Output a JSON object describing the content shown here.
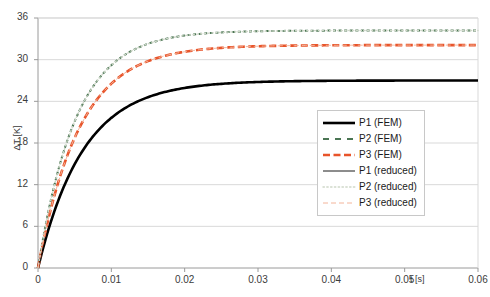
{
  "chart_data": {
    "type": "line",
    "title": "",
    "xlabel": "t [s]",
    "ylabel": "ΔT [K]",
    "xlim": [
      0,
      0.06
    ],
    "ylim": [
      0,
      36
    ],
    "xticks": [
      "0",
      "0.01",
      "0.02",
      "0.03",
      "0.04",
      "0.05",
      "0.06"
    ],
    "xtick_values": [
      0,
      0.01,
      0.02,
      0.03,
      0.04,
      0.05,
      0.06
    ],
    "yticks": [
      "0",
      "6",
      "12",
      "18",
      "24",
      "30",
      "36"
    ],
    "ytick_values": [
      0,
      6,
      12,
      18,
      24,
      30,
      36
    ],
    "grid": "horizontal",
    "legend_position": "center-right",
    "series": [
      {
        "name": "P1 (FEM)",
        "color": "#000000",
        "style": "solid",
        "width": 2.6,
        "plateau": 27.0,
        "tau": 0.0062,
        "x": [
          0,
          0.001,
          0.002,
          0.003,
          0.004,
          0.005,
          0.006,
          0.008,
          0.01,
          0.012,
          0.014,
          0.016,
          0.018,
          0.02,
          0.024,
          0.028,
          0.032,
          0.036,
          0.04,
          0.045,
          0.05,
          0.055,
          0.06
        ],
        "y": [
          0,
          4.0,
          7.5,
          10.6,
          13.3,
          15.6,
          17.6,
          20.9,
          23.2,
          24.8,
          25.9,
          26.3,
          26.6,
          26.8,
          26.9,
          27.0,
          27.0,
          27.0,
          27.0,
          27.0,
          27.0,
          27.0,
          27.0
        ]
      },
      {
        "name": "P2 (FEM)",
        "color": "#4a7553",
        "style": "dashed-short",
        "width": 2.0,
        "plateau": 34.2,
        "tau": 0.0052,
        "x": [
          0,
          0.001,
          0.002,
          0.003,
          0.004,
          0.005,
          0.006,
          0.008,
          0.01,
          0.012,
          0.014,
          0.016,
          0.018,
          0.02,
          0.024,
          0.028,
          0.032,
          0.036,
          0.04,
          0.045,
          0.05,
          0.055,
          0.06
        ],
        "y": [
          0,
          5.9,
          11.0,
          15.4,
          19.1,
          22.2,
          24.8,
          28.6,
          31.0,
          32.4,
          33.2,
          33.7,
          33.9,
          34.0,
          34.2,
          34.2,
          34.2,
          34.2,
          34.2,
          34.2,
          34.2,
          34.2,
          34.2
        ]
      },
      {
        "name": "P3 (FEM)",
        "color": "#e8542a",
        "style": "dashed",
        "width": 2.6,
        "plateau": 32.1,
        "tau": 0.0057,
        "x": [
          0,
          0.001,
          0.002,
          0.003,
          0.004,
          0.005,
          0.006,
          0.008,
          0.01,
          0.012,
          0.014,
          0.016,
          0.018,
          0.02,
          0.024,
          0.028,
          0.032,
          0.036,
          0.04,
          0.045,
          0.05,
          0.055,
          0.06
        ],
        "y": [
          0,
          5.2,
          9.8,
          13.8,
          17.2,
          20.1,
          22.6,
          26.4,
          28.9,
          30.4,
          31.2,
          31.7,
          31.9,
          32.0,
          32.1,
          32.1,
          32.1,
          32.1,
          32.1,
          32.1,
          32.1,
          32.1,
          32.1
        ]
      },
      {
        "name": "P1 (reduced)",
        "color": "#000000",
        "style": "solid-thin",
        "width": 0.9,
        "plateau": 27.0,
        "tau": 0.0062,
        "x": [
          0,
          0.001,
          0.002,
          0.003,
          0.004,
          0.005,
          0.006,
          0.008,
          0.01,
          0.012,
          0.014,
          0.016,
          0.018,
          0.02,
          0.024,
          0.028,
          0.032,
          0.036,
          0.04,
          0.045,
          0.05,
          0.055,
          0.06
        ],
        "y": [
          0,
          4.0,
          7.5,
          10.6,
          13.3,
          15.6,
          17.6,
          20.9,
          23.2,
          24.8,
          25.9,
          26.3,
          26.6,
          26.8,
          26.9,
          27.0,
          27.0,
          27.0,
          27.0,
          27.0,
          27.0,
          27.0,
          27.0
        ]
      },
      {
        "name": "P2 (reduced)",
        "color": "#cfd8c9",
        "style": "dotted",
        "width": 1.4,
        "plateau": 34.2,
        "tau": 0.0052,
        "x": [
          0,
          0.001,
          0.002,
          0.003,
          0.004,
          0.005,
          0.006,
          0.008,
          0.01,
          0.012,
          0.014,
          0.016,
          0.018,
          0.02,
          0.024,
          0.028,
          0.032,
          0.036,
          0.04,
          0.045,
          0.05,
          0.055,
          0.06
        ],
        "y": [
          0,
          5.9,
          11.0,
          15.4,
          19.1,
          22.2,
          24.8,
          28.6,
          31.0,
          32.4,
          33.2,
          33.7,
          33.9,
          34.0,
          34.2,
          34.2,
          34.2,
          34.2,
          34.2,
          34.2,
          34.2,
          34.2,
          34.2
        ]
      },
      {
        "name": "P3 (reduced)",
        "color": "#f3b49a",
        "style": "dashed-thin",
        "width": 1.0,
        "plateau": 32.1,
        "tau": 0.0057,
        "x": [
          0,
          0.001,
          0.002,
          0.003,
          0.004,
          0.005,
          0.006,
          0.008,
          0.01,
          0.012,
          0.014,
          0.016,
          0.018,
          0.02,
          0.024,
          0.028,
          0.032,
          0.036,
          0.04,
          0.045,
          0.05,
          0.055,
          0.06
        ],
        "y": [
          0,
          5.2,
          9.8,
          13.8,
          17.2,
          20.1,
          22.6,
          26.4,
          28.9,
          30.4,
          31.2,
          31.7,
          31.9,
          32.0,
          32.1,
          32.1,
          32.1,
          32.1,
          32.1,
          32.1,
          32.1,
          32.1,
          32.1
        ]
      }
    ],
    "colors": {
      "axis": "#9a9a9a",
      "grid": "#d9d9d9",
      "text": "#3b3b3b",
      "p1": "#000000",
      "p2": "#4a7553",
      "p3": "#e8542a",
      "p2_reduced": "#cfd8c9",
      "p3_reduced": "#f3b49a"
    }
  }
}
